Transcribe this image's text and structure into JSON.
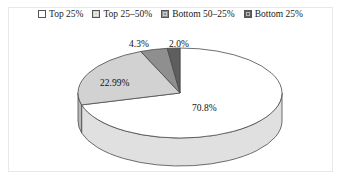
{
  "legend": {
    "items": [
      {
        "label": "Top 25%",
        "swatch": "#ffffff",
        "swatch_name": "legend-swatch-top-25"
      },
      {
        "label": "Top 25–50%",
        "swatch": "#d2d2d2",
        "swatch_name": "legend-swatch-top-25-50"
      },
      {
        "label": "Bottom 50–25%",
        "swatch": "#8f8f8f",
        "swatch_name": "legend-swatch-bottom-50-25"
      },
      {
        "label": "Bottom 25%",
        "swatch": "#5e5e5e",
        "swatch_name": "legend-swatch-bottom-25"
      }
    ]
  },
  "labels": {
    "small_mid": "4.3%",
    "small_dark": "2.0%",
    "light": "22.99%",
    "main": "70.8%"
  },
  "chart_data": {
    "type": "pie",
    "title": "",
    "subtitle": "",
    "xlabel": "",
    "ylabel": "",
    "grid": false,
    "legend_position": "top",
    "three_d": true,
    "start_angle_deg": -90,
    "direction": "clockwise",
    "categories": [
      "Top 25%",
      "Top 25–50%",
      "Bottom 50–25%",
      "Bottom 25%"
    ],
    "values": [
      70.8,
      22.99,
      4.3,
      2.0
    ],
    "data_labels": [
      "70.8%",
      "22.99%",
      "4.3%",
      "2.0%"
    ],
    "colors": [
      "#ffffff",
      "#d2d2d2",
      "#8f8f8f",
      "#5e5e5e"
    ],
    "edge_color": "#4a4a4a",
    "units": "percent",
    "total": 100.09
  }
}
